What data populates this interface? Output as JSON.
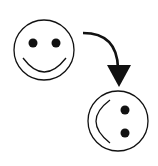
{
  "diagram": {
    "nodes": [
      {
        "id": "smiley-original",
        "shape": "smiley-face",
        "rotation_deg": 0
      },
      {
        "id": "smiley-rotated",
        "shape": "smiley-face",
        "rotation_deg": 90
      }
    ],
    "edges": [
      {
        "from": "smiley-original",
        "to": "smiley-rotated",
        "style": "curved-arrow"
      }
    ],
    "colors": {
      "stroke": "#111111",
      "background": "#ffffff"
    }
  }
}
